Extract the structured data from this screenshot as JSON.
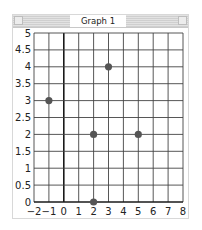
{
  "window": {
    "title": "Graph 1"
  },
  "chart_data": {
    "type": "scatter",
    "title": "Graph 1",
    "xlabel": "",
    "ylabel": "",
    "xlim": [
      -2,
      8
    ],
    "ylim": [
      0,
      5
    ],
    "grid": true,
    "x_ticks": [
      "−2",
      "−1",
      "0",
      "1",
      "2",
      "3",
      "4",
      "5",
      "6",
      "7",
      "8"
    ],
    "y_ticks": [
      "0",
      "0.5",
      "1",
      "1.5",
      "2",
      "2.5",
      "3",
      "3.5",
      "4",
      "4.5",
      "5"
    ],
    "series": [
      {
        "name": "points",
        "color": "#555555",
        "points": [
          {
            "x": -1,
            "y": 3
          },
          {
            "x": 3,
            "y": 4
          },
          {
            "x": 2,
            "y": 2
          },
          {
            "x": 5,
            "y": 2
          },
          {
            "x": 2,
            "y": 0
          }
        ]
      }
    ]
  }
}
